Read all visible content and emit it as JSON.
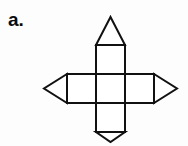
{
  "page": {
    "background_color": "#fdfdfd",
    "width": 188,
    "height": 146
  },
  "label": {
    "text": "a.",
    "color": "#0b0b0b"
  },
  "figure": {
    "name": "net-of-octahedron-cross",
    "stroke_color": "#111111",
    "fill_color": "#ffffff",
    "stroke_width": 2,
    "geometry": {
      "square_size": 29,
      "grid_left": 96,
      "grid_top": 45,
      "columns": 3,
      "rows": 3,
      "center_column_index": 1,
      "center_row_index": 1,
      "triangle_apex_top": {
        "x": 110.5,
        "y": 17
      },
      "triangle_apex_bottom": {
        "x": 110.5,
        "y": 142
      },
      "triangle_apex_left": {
        "x": 44,
        "y": 74.5
      },
      "triangle_apex_right": {
        "x": 177,
        "y": 74.5
      }
    },
    "squares": [
      {
        "name": "top-square",
        "x": 96,
        "y": 45,
        "w": 29,
        "h": 29
      },
      {
        "name": "center-square",
        "x": 96,
        "y": 74,
        "w": 29,
        "h": 29
      },
      {
        "name": "bottom-square",
        "x": 96,
        "y": 103,
        "w": 29,
        "h": 29
      },
      {
        "name": "left-square",
        "x": 67,
        "y": 74,
        "w": 29,
        "h": 29
      },
      {
        "name": "right-square",
        "x": 125,
        "y": 74,
        "w": 29,
        "h": 29
      }
    ],
    "triangles": [
      {
        "name": "top-triangle",
        "points": "96,45 125,45 110.5,17"
      },
      {
        "name": "bottom-triangle",
        "points": "96,132 125,132 110.5,142"
      },
      {
        "name": "left-triangle",
        "points": "67,74 67,103 44,88.5"
      },
      {
        "name": "right-triangle",
        "points": "154,74 154,103 177,88.5"
      }
    ]
  }
}
